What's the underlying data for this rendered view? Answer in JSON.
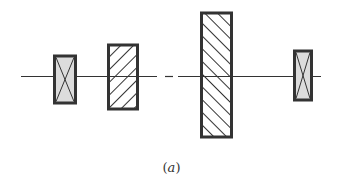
{
  "diagram": {
    "caption_open": "(",
    "caption_letter": "a",
    "caption_close": ")",
    "colors": {
      "stroke": "#333333",
      "fill_bearing": "#dcdcdc",
      "background": "#ffffff"
    },
    "elements": [
      {
        "name": "left-bearing",
        "type": "bearing-x",
        "x": 53,
        "y": 55,
        "w": 24,
        "h": 49
      },
      {
        "name": "small-gear",
        "type": "hatched-backslash",
        "x": 107,
        "y": 44,
        "w": 32,
        "h": 66
      },
      {
        "name": "large-gear",
        "type": "hatched-slash",
        "x": 200,
        "y": 12,
        "w": 33,
        "h": 126
      },
      {
        "name": "right-bearing",
        "type": "bearing-x",
        "x": 293,
        "y": 50,
        "w": 20,
        "h": 51
      }
    ],
    "shaft": {
      "y": 76,
      "x_start": 21,
      "x_end": 321
    }
  }
}
